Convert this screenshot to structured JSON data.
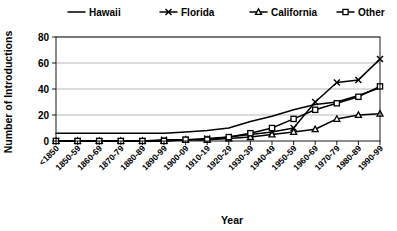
{
  "chart_data": {
    "type": "line",
    "title": "",
    "xlabel": "Year",
    "ylabel": "Number of Introductions",
    "ylim": [
      0,
      80
    ],
    "yticks": [
      0,
      20,
      40,
      60,
      80
    ],
    "grid": true,
    "legend_position": "top",
    "categories": [
      "<1850",
      "1850-59",
      "1860-69",
      "1870-79",
      "1880-89",
      "1890-99",
      "1900-09",
      "1910-19",
      "1920-29",
      "1930-39",
      "1940-49",
      "1950-59",
      "1960-69",
      "1970-79",
      "1980-89",
      "1990-99"
    ],
    "series": [
      {
        "name": "Hawaii",
        "marker": "none",
        "values": [
          6,
          6,
          6,
          6,
          6,
          6,
          7,
          8,
          10,
          15,
          19,
          24,
          28,
          30,
          35,
          41
        ]
      },
      {
        "name": "Florida",
        "marker": "x",
        "values": [
          0,
          0,
          0,
          0,
          0,
          1,
          1,
          2,
          3,
          5,
          7,
          10,
          30,
          45,
          47,
          63
        ]
      },
      {
        "name": "California",
        "marker": "triangle",
        "values": [
          0,
          0,
          0,
          0,
          0,
          0,
          1,
          1,
          2,
          3,
          5,
          7,
          9,
          17,
          20,
          21
        ]
      },
      {
        "name": "Other",
        "marker": "square",
        "values": [
          0,
          0,
          0,
          0,
          0,
          0,
          1,
          1,
          3,
          6,
          10,
          17,
          24,
          29,
          34,
          42
        ]
      }
    ]
  },
  "axis": {
    "ylabel": "Number of Introductions",
    "xlabel": "Year"
  }
}
